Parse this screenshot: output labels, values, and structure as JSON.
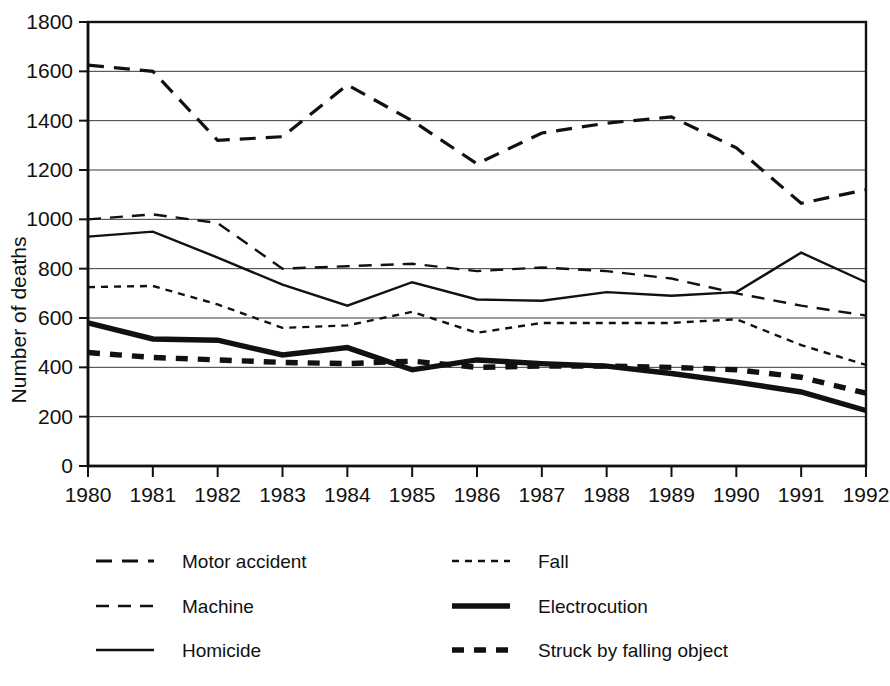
{
  "chart_data": {
    "type": "line",
    "title": "",
    "xlabel": "",
    "ylabel": "Number of deaths",
    "grid": true,
    "legend_position": "bottom",
    "xlim": [
      1980,
      1992
    ],
    "ylim": [
      0,
      1800
    ],
    "ytick_step": 200,
    "categories": [
      1980,
      1981,
      1982,
      1983,
      1984,
      1985,
      1986,
      1987,
      1988,
      1989,
      1990,
      1991,
      1992
    ],
    "x_tick_labels": [
      "1980",
      "1981",
      "1982",
      "1983",
      "1984",
      "1985",
      "1986",
      "1987",
      "1988",
      "1989",
      "1990",
      "1991",
      "1992"
    ],
    "y_tick_labels": [
      "0",
      "200",
      "400",
      "600",
      "800",
      "1000",
      "1200",
      "1400",
      "1600",
      "1800"
    ],
    "series": [
      {
        "name": "Motor accident",
        "style": "long-dash",
        "color": "#111111",
        "width": 3.2,
        "dash": "16,10",
        "values": [
          1625,
          1600,
          1320,
          1335,
          1545,
          1400,
          1225,
          1350,
          1390,
          1415,
          1290,
          1065,
          1120
        ]
      },
      {
        "name": "Machine",
        "style": "medium-dash",
        "color": "#111111",
        "width": 2.4,
        "dash": "13,9",
        "values": [
          1000,
          1020,
          985,
          800,
          810,
          820,
          790,
          805,
          790,
          760,
          700,
          650,
          610
        ]
      },
      {
        "name": "Homicide",
        "style": "solid",
        "color": "#111111",
        "width": 2.4,
        "dash": "none",
        "values": [
          930,
          950,
          845,
          735,
          650,
          745,
          675,
          670,
          705,
          690,
          705,
          865,
          745
        ]
      },
      {
        "name": "Fall",
        "style": "fine-dash",
        "color": "#111111",
        "width": 2.4,
        "dash": "7,6",
        "values": [
          725,
          730,
          655,
          560,
          570,
          625,
          540,
          580,
          580,
          580,
          595,
          490,
          410
        ]
      },
      {
        "name": "Electrocution",
        "style": "thick-solid",
        "color": "#111111",
        "width": 5.4,
        "dash": "none",
        "values": [
          580,
          515,
          510,
          450,
          480,
          390,
          430,
          415,
          405,
          375,
          340,
          300,
          225
        ]
      },
      {
        "name": "Struck by falling object",
        "style": "thick-dash",
        "color": "#111111",
        "width": 5.4,
        "dash": "12,10",
        "values": [
          460,
          440,
          430,
          420,
          415,
          425,
          400,
          405,
          405,
          400,
          390,
          360,
          295
        ]
      }
    ]
  },
  "legend": {
    "left_column": [
      {
        "label": "Motor accident",
        "key": "motor-accident"
      },
      {
        "label": "Machine",
        "key": "machine"
      },
      {
        "label": "Homicide",
        "key": "homicide"
      }
    ],
    "right_column": [
      {
        "label": "Fall",
        "key": "fall"
      },
      {
        "label": "Electrocution",
        "key": "electrocution"
      },
      {
        "label": "Struck by falling object",
        "key": "struck-by-falling-object"
      }
    ]
  }
}
